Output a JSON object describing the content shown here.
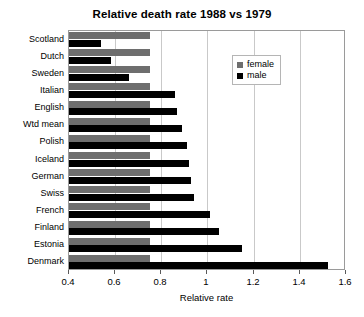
{
  "chart_data": {
    "type": "bar",
    "orientation": "horizontal",
    "title": "Relative death rate 1988 vs 1979",
    "xlabel": "Relative rate",
    "ylabel": "",
    "xlim": [
      0.4,
      1.6
    ],
    "xticks": [
      "0.4",
      "0.6",
      "0.8",
      "1",
      "1.2",
      "1.4",
      "1.6"
    ],
    "xtick_values": [
      0.4,
      0.6,
      0.8,
      1.0,
      1.2,
      1.4,
      1.6
    ],
    "grid": "vertical",
    "legend_position": "upper right",
    "categories": [
      "Scotland",
      "Dutch",
      "Sweden",
      "Italian",
      "English",
      "Wtd mean",
      "Polish",
      "Iceland",
      "German",
      "Swiss",
      "French",
      "Finland",
      "Estonia",
      "Denmark"
    ],
    "series": [
      {
        "name": "female",
        "color": "#6e6e6e",
        "values": [
          0.75,
          0.75,
          0.75,
          0.75,
          0.75,
          0.75,
          0.75,
          0.75,
          0.75,
          0.75,
          0.75,
          0.75,
          0.75,
          0.75
        ]
      },
      {
        "name": "male",
        "color": "#000000",
        "values": [
          0.54,
          0.58,
          0.66,
          0.86,
          0.87,
          0.89,
          0.91,
          0.92,
          0.93,
          0.94,
          1.01,
          1.05,
          1.15,
          1.52
        ]
      }
    ]
  },
  "legend": {
    "items": [
      {
        "label": "female",
        "color": "#6e6e6e"
      },
      {
        "label": "male",
        "color": "#000000"
      }
    ]
  }
}
